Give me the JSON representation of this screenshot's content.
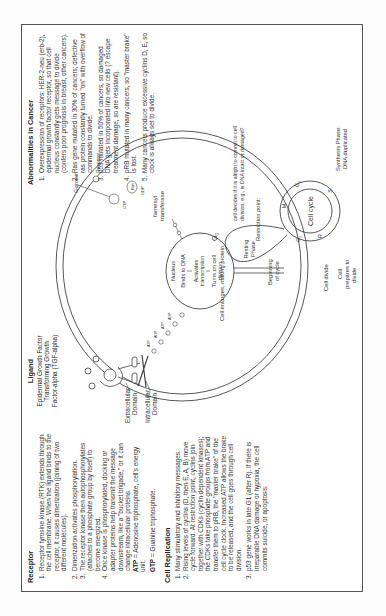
{
  "receptor": {
    "title": "Receptor",
    "items": [
      "Receptor tyrosine kinase (RTK) extends through the cell membrane. When the ligand binds to the receptor, it causes dimerization (joining of two different molecules).",
      "Dimerization activates phosphorylation.",
      "The receptor kinase then autophosphorylates (attaches to a phosphate group by itself) to become energized.",
      "Once kinase is phosphorylated, docking or adapter proteins help transmit the message downstream, like a \"bucket brigade,\" or it can change intracellular proteins."
    ],
    "atp_term": "ATP",
    "atp_def": " = Adenosine triphosphate, cell's energy unit.",
    "gtp_term": "GTP",
    "gtp_def": " = Guanine triphosphate."
  },
  "cell_replication": {
    "title": "Cell Replication",
    "items": [
      "Many stimulatory and inhibitory messages.",
      "Rising levels of cyclins (D, then E, A, B) move cycle forward. At restriction point, cyclins join together with CDKs (cyclin dependent kinases); the CDKs take phosphate groups from ATP and transfer them to pRB, the \"master brake\" of the cell cycle clock. Increased ATP allows the brake to be released, and the cell goes through cell division.",
      "p53 gene works in late G1 (after R). If there is irreparable DNA damage or hypoxia, the cell commits suicide, or apoptosis."
    ]
  },
  "ligand": {
    "title": "Ligand",
    "lines": [
      "Epidermal Growth Factor",
      "Transforming Growth",
      "Factor-alpha (TGF-alpha)"
    ]
  },
  "cancer": {
    "title": "Abnormalities in Cancer",
    "items": [
      "Overexpression of receptors: HER-2-neu (erb-2), epidermal growth factor receptor, so that cell nucleus constantly gets message to divide (confers poor prognosis in breast, other cancers).",
      "Ras gene mutated in 30% of cancers; defective ras protein constantly turned \"on\" with overflow of commands to divide.",
      "p53 mutated in 50% of cancers, so damaged DNA gets incorporated into new cells (? escape treatment damage, so are resistant).",
      "pRB mutated in many cancers, so \"master brake\" is lost.",
      "Many cancers produce excessive cyclins D, E, so clock is always set to divide."
    ]
  },
  "diagram": {
    "extracellular_domain": [
      "Extracellular",
      "Domain"
    ],
    "intracellular_domain": [
      "Intracellular",
      "Domain"
    ],
    "g_protein": "G-protein",
    "receptor_label": "Receptor",
    "ras": "Ras",
    "gtp": "GTP",
    "gdp": "GDP",
    "farnesyl": [
      "farnesyl",
      "transferase"
    ],
    "nucleus": "Nucleus",
    "binds_dna": "Binds to DNA",
    "activates": [
      "Activates",
      "transcription"
    ],
    "turns_on": [
      "Turns on cell",
      "division"
    ],
    "atp": "ATP",
    "adp": "ADP",
    "cell_enlarges": "Cell enlarges, making protein",
    "g0": "G",
    "g0_sub": "0",
    "resting": [
      "Resting",
      "Phase"
    ],
    "beginning": [
      "Beginning",
      "of cycle"
    ],
    "restriction": [
      "Restriction point:",
      "cell decides if it is alright to commit to cell",
      "division, e.g., is DNA intact or damaged?"
    ],
    "cell_cycle": "Cell cycle",
    "phase_g1": "G",
    "phase_g1_sub": "1",
    "phase_r": "R",
    "phase_s": "S",
    "phase_g2": "G",
    "phase_g2_sub": "2",
    "phase_m": "M",
    "synthesis": [
      "Synthesis Phase:",
      "DNA duplicated"
    ],
    "cell_divide": "Cell divide",
    "prepares": [
      "Cell",
      "prepares to",
      "divide"
    ]
  }
}
